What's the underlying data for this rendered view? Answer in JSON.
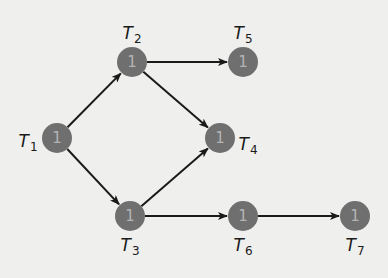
{
  "diagram": {
    "type": "directed-acyclic-graph",
    "colors": {
      "background": "#efefee",
      "node_fill": "#6f6f6f",
      "node_text": "#b4b4b4",
      "edge": "#1a1a1a",
      "label": "#1a1a1a"
    },
    "nodes": [
      {
        "id": "T1",
        "label_main": "T",
        "label_sub": "1",
        "value": "1",
        "x": 57,
        "y": 138,
        "label_x": 28,
        "label_y": 142
      },
      {
        "id": "T2",
        "label_main": "T",
        "label_sub": "2",
        "value": "1",
        "x": 132,
        "y": 62,
        "label_x": 132,
        "label_y": 34
      },
      {
        "id": "T3",
        "label_main": "T",
        "label_sub": "3",
        "value": "1",
        "x": 130,
        "y": 216,
        "label_x": 130,
        "label_y": 246
      },
      {
        "id": "T4",
        "label_main": "T",
        "label_sub": "4",
        "value": "1",
        "x": 220,
        "y": 138,
        "label_x": 248,
        "label_y": 145
      },
      {
        "id": "T5",
        "label_main": "T",
        "label_sub": "5",
        "value": "1",
        "x": 243,
        "y": 62,
        "label_x": 243,
        "label_y": 34
      },
      {
        "id": "T6",
        "label_main": "T",
        "label_sub": "6",
        "value": "1",
        "x": 243,
        "y": 216,
        "label_x": 243,
        "label_y": 246
      },
      {
        "id": "T7",
        "label_main": "T",
        "label_sub": "7",
        "value": "1",
        "x": 355,
        "y": 216,
        "label_x": 355,
        "label_y": 246
      }
    ],
    "edges": [
      {
        "from": "T1",
        "to": "T2"
      },
      {
        "from": "T1",
        "to": "T3"
      },
      {
        "from": "T2",
        "to": "T5"
      },
      {
        "from": "T2",
        "to": "T4"
      },
      {
        "from": "T3",
        "to": "T4"
      },
      {
        "from": "T3",
        "to": "T6"
      },
      {
        "from": "T6",
        "to": "T7"
      }
    ]
  }
}
